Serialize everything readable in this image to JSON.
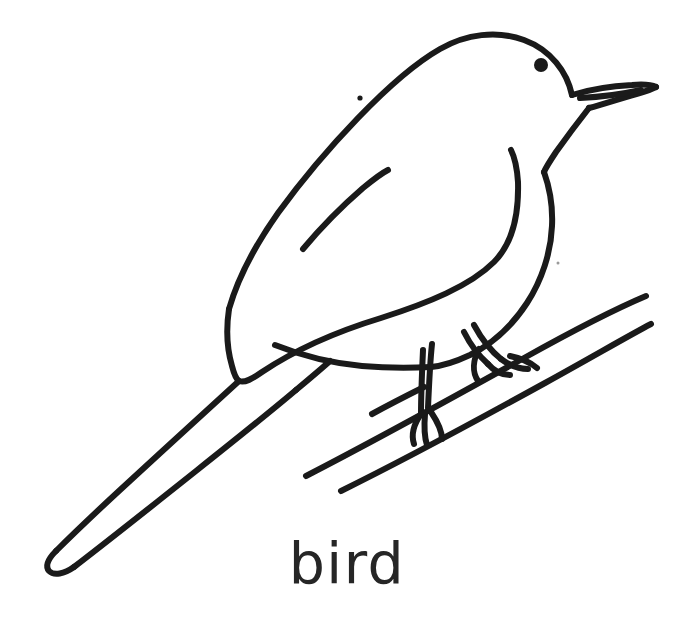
{
  "page": {
    "kind": "line-art-coloring-page",
    "width": 694,
    "height": 620,
    "background_color": "#ffffff",
    "ink_color": "#1a1a1a",
    "stroke_width_px": 6
  },
  "caption": {
    "text": "bird",
    "color": "#262626",
    "font_size_px": 57,
    "case": "lowercase",
    "align": "center",
    "baseline_y": 583
  },
  "subject": {
    "name": "bird",
    "description": "Outline drawing of a small perching songbird facing right, standing on a thin diagonal branch, with a long tapering tail pointing down to the lower left.",
    "facing": "right",
    "fill": "none"
  },
  "parts": [
    {
      "name": "head-and-crown",
      "label": "Head and crown",
      "description": "Rounded dome from the upper back up over the crown and down to the beak.",
      "anchor": [
        500,
        55
      ]
    },
    {
      "name": "eye",
      "label": "Eye",
      "description": "Small solid black round dot on the head.",
      "center": [
        541,
        65
      ],
      "radius": 6,
      "filled": true,
      "color": "#1a1a1a"
    },
    {
      "name": "beak",
      "label": "Beak",
      "description": "Pointed triangular beak at the right with an upper and a lower mandible line meeting at the tip.",
      "tip": [
        656,
        88
      ]
    },
    {
      "name": "body-outline",
      "label": "Body outline",
      "description": "Large teardrop body running from the head down the right side to the belly and back up to the tail base.",
      "anchor": [
        470,
        230
      ]
    },
    {
      "name": "wing",
      "label": "Wing",
      "description": "Long pointed wing shape over the body, tip reaching the tail base at lower left.",
      "tip": [
        233,
        378
      ]
    },
    {
      "name": "feather-stroke",
      "label": "Wing feather line",
      "description": "Short inner line inside the wing suggesting feathers.",
      "from": [
        305,
        247
      ],
      "to": [
        387,
        171
      ]
    },
    {
      "name": "tail",
      "label": "Tail",
      "description": "Long straight band with a rounded tip extending to the lower-left corner.",
      "tip": [
        48,
        558
      ]
    },
    {
      "name": "leg-rear",
      "label": "Rear leg",
      "description": "Left leg going down from the belly to the branch with toes curled around it.",
      "anchor": [
        420,
        380
      ]
    },
    {
      "name": "leg-front",
      "label": "Front leg",
      "description": "Right leg going down from the belly to the branch with toes curled around it.",
      "anchor": [
        480,
        355
      ]
    },
    {
      "name": "branch",
      "label": "Branch",
      "description": "Two long parallel diagonal lines forming a thin branch rising from lower left to upper right, plus a shorter twig line below.",
      "from": [
        305,
        477
      ],
      "to": [
        650,
        300
      ]
    },
    {
      "name": "stray-dot-upper",
      "label": "Stray ink dot",
      "description": "Tiny isolated ink speck above the wing.",
      "center": [
        360,
        98
      ],
      "radius": 2.5
    },
    {
      "name": "stray-dot-lower",
      "label": "Faint ink speck",
      "description": "Very faint isolated speck to the right of the body.",
      "center": [
        558,
        263
      ],
      "radius": 1.6
    }
  ]
}
